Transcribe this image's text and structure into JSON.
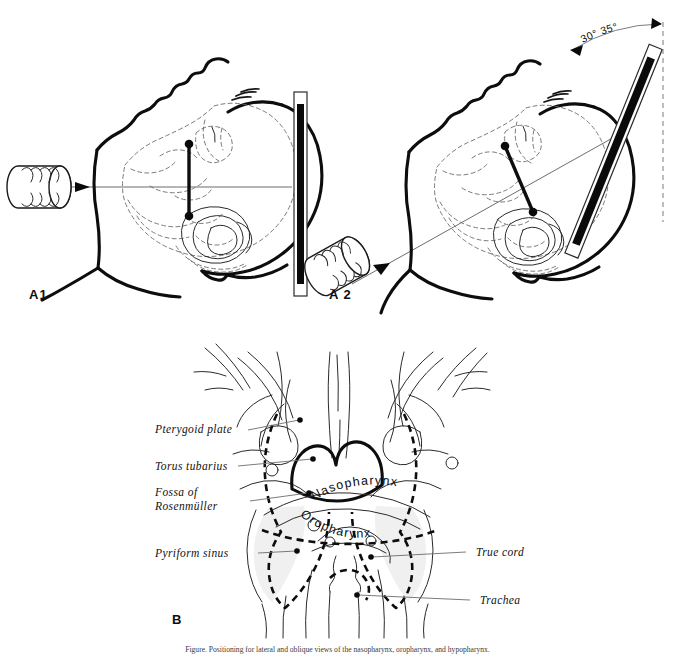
{
  "figure": {
    "background_color": "#ffffff",
    "ink_color": "#0d0d0d",
    "panels": [
      {
        "id": "A1",
        "label": "A1"
      },
      {
        "id": "A2",
        "label": "A2"
      },
      {
        "id": "B",
        "label": "B"
      }
    ]
  },
  "panel_a1": {
    "label": "A1",
    "description_parts": {
      "xray_tube": "x-ray-tube",
      "cassette": "film-cassette",
      "head": "head-profile-extended",
      "beam": "horizontal-central-ray"
    }
  },
  "panel_a2": {
    "label": "A 2",
    "angle_label": "30° 35°",
    "angle_value_min": 30,
    "angle_value_max": 35,
    "angle_unit": "degrees",
    "description_parts": {
      "xray_tube": "x-ray-tube-angled",
      "cassette": "film-cassette-tilted",
      "head": "head-profile-extended",
      "beam": "angled-central-ray",
      "reference": "vertical-reference-line"
    }
  },
  "panel_b": {
    "label": "B",
    "airway_labels": [
      {
        "id": "nasopharynx",
        "text": "Nasopharynx"
      },
      {
        "id": "oropharynx",
        "text": "Oropharynx"
      }
    ],
    "leader_labels": [
      {
        "id": "pterygoid-plate",
        "lines": [
          "Pterygoid plate"
        ],
        "side": "left"
      },
      {
        "id": "torus-tubarius",
        "lines": [
          "Torus tubarius"
        ],
        "side": "left"
      },
      {
        "id": "fossa-of-rosenmuller",
        "lines": [
          "Fossa of",
          "Rosenmüller"
        ],
        "side": "left"
      },
      {
        "id": "pyriform-sinus",
        "lines": [
          "Pyriform sinus"
        ],
        "side": "left"
      },
      {
        "id": "true-cord",
        "lines": [
          "True cord"
        ],
        "side": "right"
      },
      {
        "id": "trachea",
        "lines": [
          "Trachea"
        ],
        "side": "right"
      }
    ]
  },
  "caption": {
    "text": "Figure. Positioning for lateral and oblique views of the nasopharynx, oropharynx, and hypopharynx."
  }
}
